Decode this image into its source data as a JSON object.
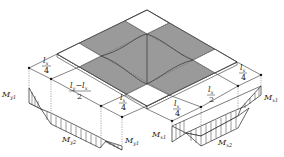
{
  "figure": {
    "colors": {
      "shaded_strip": "#9a9a9a",
      "corner_panel": "#ffffff",
      "line": "#222222",
      "background": "#ffffff"
    }
  },
  "dimensions": {
    "left_side": [
      {
        "id": "ly-edge-strip-1",
        "numerator": "l",
        "numerator_sub": "x",
        "denominator": "4"
      },
      {
        "id": "ly-middle-strip",
        "numerator": "l",
        "numerator_sub": "y",
        "minus": "−",
        "numerator2": "l",
        "numerator2_sub": "x",
        "denominator": "2"
      },
      {
        "id": "ly-edge-strip-2",
        "numerator": "l",
        "numerator_sub": "x",
        "denominator": "4"
      }
    ],
    "right_side": [
      {
        "id": "lx-edge-strip-1",
        "numerator": "l",
        "numerator_sub": "x",
        "denominator": "4"
      },
      {
        "id": "lx-middle-strip",
        "numerator": "l",
        "numerator_sub": "x",
        "denominator": "2"
      },
      {
        "id": "lx-edge-strip-2",
        "numerator": "l",
        "numerator_sub": "x",
        "denominator": "4"
      }
    ]
  },
  "moments": {
    "y_direction": {
      "support_left": {
        "symbol": "M",
        "sub": "y1"
      },
      "midspan": {
        "symbol": "M",
        "sub": "y2"
      },
      "support_right": {
        "symbol": "M",
        "sub": "y1"
      }
    },
    "x_direction": {
      "support_left": {
        "symbol": "M",
        "sub": "x1"
      },
      "midspan": {
        "symbol": "M",
        "sub": "x2"
      },
      "support_right": {
        "symbol": "M",
        "sub": "x1"
      }
    }
  }
}
